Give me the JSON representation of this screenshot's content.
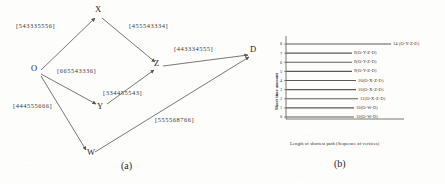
{
  "figure": {
    "panel_a": {
      "caption": "(a)",
      "nodes": [
        {
          "id": "O",
          "label": "O",
          "x": 36,
          "y": 68
        },
        {
          "id": "X",
          "label": "X",
          "x": 98,
          "y": 9
        },
        {
          "id": "Y",
          "label": "Y",
          "x": 99,
          "y": 107
        },
        {
          "id": "Z",
          "label": "Z",
          "x": 155,
          "y": 64
        },
        {
          "id": "W",
          "label": "W",
          "x": 88,
          "y": 152
        },
        {
          "id": "D",
          "label": "D",
          "x": 252,
          "y": 50
        }
      ],
      "edges": [
        {
          "from": "O",
          "to": "X",
          "label": "[543335556]",
          "lx": 16,
          "ly": 22
        },
        {
          "from": "X",
          "to": "Z",
          "label": "[455543334]",
          "lx": 129,
          "ly": 22
        },
        {
          "from": "Z",
          "to": "D",
          "label": "[443334555]",
          "lx": 174,
          "ly": 45
        },
        {
          "from": "O",
          "to": "Y",
          "label": "[665543336]",
          "lx": 57,
          "ly": 67
        },
        {
          "from": "Y",
          "to": "Z",
          "label": "[334455543]",
          "lx": 103,
          "ly": 89
        },
        {
          "from": "O",
          "to": "W",
          "label": "[444555666]",
          "lx": 13,
          "ly": 102
        },
        {
          "from": "W",
          "to": "D",
          "label": "[555568766]",
          "lx": 155,
          "ly": 116
        }
      ]
    },
    "panel_b": {
      "caption": "(b)"
    }
  },
  "chart_data": {
    "type": "bar",
    "orientation": "horizontal",
    "title": "",
    "xlabel": "Length of shortest path (Sequence of vertices)",
    "ylabel": "Short time amount",
    "ylim": [
      0,
      8
    ],
    "grid": false,
    "legend": "none",
    "yticks": [
      "0",
      "1",
      "2",
      "3",
      "4",
      "5",
      "6",
      "7",
      "8"
    ],
    "categories": [
      "10(O-W-D)",
      "10(O-W-D)",
      "11(O-X-Z-D)",
      "10(O-X-Z-D)",
      "10(O-X-Z-D)",
      "9(O-Y-Z-D)",
      "9(O-Y-Z-D)",
      "9(O-Y-Z-D)",
      "14 (O-Y-Z-D)"
    ],
    "values": [
      68,
      68,
      72,
      70,
      70,
      66,
      66,
      66,
      105
    ],
    "bars": [
      {
        "tick": "0",
        "label": "10(O-W-D)",
        "length": 68
      },
      {
        "tick": "1",
        "label": "10(O-W-D)",
        "length": 68
      },
      {
        "tick": "2",
        "label": "11(O-X-Z-D)",
        "length": 72
      },
      {
        "tick": "3",
        "label": "10(O-X-Z-D)",
        "length": 70
      },
      {
        "tick": "4",
        "label": "10(O-X-Z-D)",
        "length": 70
      },
      {
        "tick": "5",
        "label": "9(O-Y-Z-D)",
        "length": 66
      },
      {
        "tick": "6",
        "label": "9(O-Y-Z-D)",
        "length": 66
      },
      {
        "tick": "7",
        "label": "9(O-Y-Z-D)",
        "length": 66
      },
      {
        "tick": "8",
        "label": "14 (O-Y-Z-D)",
        "length": 105
      }
    ]
  },
  "colors": {
    "ink": "#2b2b2b",
    "line": "#555555",
    "paper": "#fdfdfc",
    "axis": "#666666"
  }
}
